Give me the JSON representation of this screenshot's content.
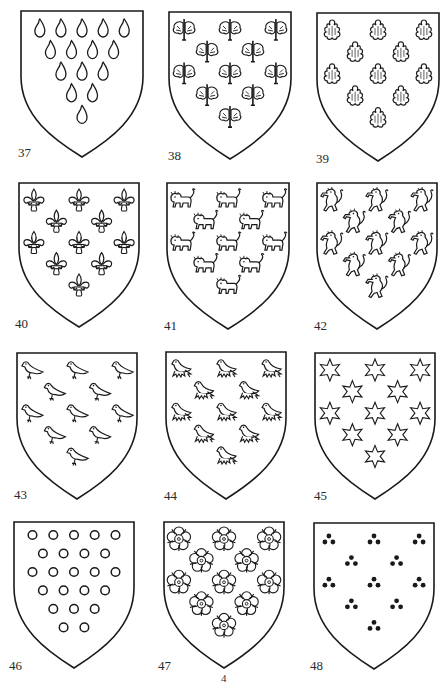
{
  "page": {
    "number": "4",
    "ink_color": "#1a1a1a",
    "paper_color": "#ffffff"
  },
  "shields": [
    {
      "id": "37",
      "label": "37",
      "charge": "goutte",
      "charge_icon": "drop-icon",
      "arrangement": [
        5,
        4,
        3,
        2,
        1
      ],
      "count": 15,
      "x": 20,
      "y": 10,
      "w": 124,
      "h": 148,
      "label_x": 18,
      "label_y": 145
    },
    {
      "id": "38",
      "label": "38",
      "charge": "leaf-sprig",
      "charge_icon": "leaf-sprig-icon",
      "arrangement": [
        3,
        2,
        3,
        2,
        1
      ],
      "count": 11,
      "x": 168,
      "y": 11,
      "w": 124,
      "h": 149,
      "label_x": 168,
      "label_y": 148
    },
    {
      "id": "39",
      "label": "39",
      "charge": "escallop",
      "charge_icon": "escallop-shell-icon",
      "arrangement": [
        3,
        2,
        3,
        2,
        1
      ],
      "count": 11,
      "x": 316,
      "y": 12,
      "w": 124,
      "h": 150,
      "label_x": 316,
      "label_y": 151
    },
    {
      "id": "40",
      "label": "40",
      "charge": "fleur-de-lis",
      "charge_icon": "fleur-de-lis-icon",
      "arrangement": [
        3,
        2,
        3,
        2,
        1
      ],
      "count": 11,
      "x": 18,
      "y": 182,
      "w": 122,
      "h": 146,
      "label_x": 15,
      "label_y": 316
    },
    {
      "id": "41",
      "label": "41",
      "charge": "lion-passant",
      "charge_icon": "lion-passant-icon",
      "arrangement": [
        3,
        2,
        3,
        2,
        1
      ],
      "count": 11,
      "x": 166,
      "y": 182,
      "w": 124,
      "h": 148,
      "label_x": 164,
      "label_y": 318
    },
    {
      "id": "42",
      "label": "42",
      "charge": "lion-rampant",
      "charge_icon": "lion-rampant-icon",
      "arrangement": [
        3,
        2,
        3,
        2,
        1
      ],
      "count": 11,
      "x": 316,
      "y": 182,
      "w": 122,
      "h": 148,
      "label_x": 314,
      "label_y": 318
    },
    {
      "id": "43",
      "label": "43",
      "charge": "bird",
      "charge_icon": "bird-icon",
      "arrangement": [
        3,
        2,
        3,
        2,
        1
      ],
      "count": 11,
      "x": 16,
      "y": 352,
      "w": 122,
      "h": 148,
      "label_x": 14,
      "label_y": 487
    },
    {
      "id": "44",
      "label": "44",
      "charge": "martlet",
      "charge_icon": "martlet-icon",
      "arrangement": [
        3,
        2,
        3,
        2,
        1
      ],
      "count": 11,
      "x": 165,
      "y": 351,
      "w": 122,
      "h": 149,
      "label_x": 164,
      "label_y": 488
    },
    {
      "id": "45",
      "label": "45",
      "charge": "six-pointed-star",
      "charge_icon": "star-icon",
      "arrangement": [
        3,
        2,
        3,
        2,
        1
      ],
      "count": 11,
      "x": 314,
      "y": 352,
      "w": 122,
      "h": 148,
      "label_x": 314,
      "label_y": 488
    },
    {
      "id": "46",
      "label": "46",
      "charge": "annulet",
      "charge_icon": "annulet-icon",
      "arrangement": [
        5,
        4,
        5,
        4,
        3,
        2
      ],
      "count": 23,
      "x": 13,
      "y": 521,
      "w": 122,
      "h": 148,
      "label_x": 9,
      "label_y": 658
    },
    {
      "id": "47",
      "label": "47",
      "charge": "rose",
      "charge_icon": "rose-icon",
      "arrangement": [
        3,
        2,
        3,
        2,
        1
      ],
      "count": 11,
      "x": 163,
      "y": 521,
      "w": 122,
      "h": 148,
      "label_x": 158,
      "label_y": 658
    },
    {
      "id": "48",
      "label": "48",
      "charge": "three-pellets",
      "charge_icon": "pellets-icon",
      "arrangement": [
        3,
        2,
        3,
        2,
        1
      ],
      "count": 11,
      "x": 313,
      "y": 522,
      "w": 122,
      "h": 148,
      "label_x": 310,
      "label_y": 658
    }
  ]
}
